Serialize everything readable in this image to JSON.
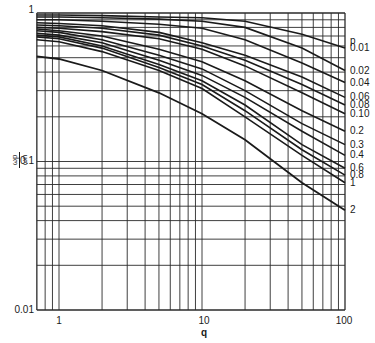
{
  "chart_data": {
    "type": "line",
    "title": "",
    "xlabel": "q",
    "ylabel": "ωp/ωn",
    "xscale": "log",
    "yscale": "log",
    "xlim": [
      0.7,
      100
    ],
    "ylim": [
      0.01,
      1
    ],
    "grid": true,
    "x_ticks": [
      "1",
      "10",
      "100"
    ],
    "y_ticks": [
      "0.01",
      "0.1",
      "1"
    ],
    "legend_title": "p",
    "legend_position": "right, labels at curve ends",
    "x": [
      0.7,
      1,
      2,
      5,
      10,
      20,
      50,
      100
    ],
    "series": [
      {
        "name": "0.01",
        "values": [
          0.97,
          0.97,
          0.96,
          0.94,
          0.93,
          0.88,
          0.72,
          0.58
        ]
      },
      {
        "name": "0.02",
        "values": [
          0.94,
          0.94,
          0.93,
          0.91,
          0.88,
          0.8,
          0.58,
          0.41
        ]
      },
      {
        "name": "0.04",
        "values": [
          0.9,
          0.9,
          0.88,
          0.84,
          0.79,
          0.66,
          0.46,
          0.34
        ]
      },
      {
        "name": "0.06",
        "values": [
          0.86,
          0.85,
          0.82,
          0.74,
          0.63,
          0.52,
          0.37,
          0.27
        ]
      },
      {
        "name": "0.08",
        "values": [
          0.83,
          0.82,
          0.79,
          0.71,
          0.6,
          0.48,
          0.33,
          0.24
        ]
      },
      {
        "name": "0.10",
        "values": [
          0.8,
          0.79,
          0.75,
          0.67,
          0.57,
          0.44,
          0.29,
          0.21
        ]
      },
      {
        "name": "0.2",
        "values": [
          0.78,
          0.76,
          0.7,
          0.57,
          0.47,
          0.35,
          0.22,
          0.16
        ]
      },
      {
        "name": "0.3",
        "values": [
          0.76,
          0.74,
          0.66,
          0.52,
          0.42,
          0.3,
          0.18,
          0.13
        ]
      },
      {
        "name": "0.4",
        "values": [
          0.73,
          0.71,
          0.63,
          0.48,
          0.38,
          0.27,
          0.16,
          0.11
        ]
      },
      {
        "name": "0.6",
        "values": [
          0.71,
          0.69,
          0.6,
          0.45,
          0.35,
          0.24,
          0.13,
          0.09
        ]
      },
      {
        "name": "0.8",
        "values": [
          0.69,
          0.67,
          0.58,
          0.43,
          0.33,
          0.22,
          0.12,
          0.081
        ]
      },
      {
        "name": "1",
        "values": [
          0.66,
          0.64,
          0.55,
          0.41,
          0.31,
          0.2,
          0.11,
          0.072
        ]
      },
      {
        "name": "2",
        "values": [
          0.51,
          0.49,
          0.41,
          0.29,
          0.21,
          0.14,
          0.072,
          0.047
        ]
      }
    ]
  },
  "axes": {
    "x_tick_labels": [
      "1",
      "10",
      "100"
    ],
    "y_tick_labels": [
      "1",
      "0.1",
      "0.01"
    ],
    "x_title": "q",
    "y_title_num": "ωp",
    "y_title_den": "ωn",
    "legend_title": "p"
  }
}
